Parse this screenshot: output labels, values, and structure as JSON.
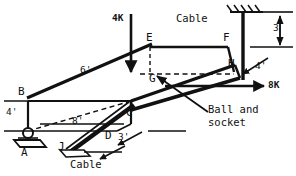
{
  "figure": {
    "type": "engineering-statics-free-body-diagram",
    "stroke_color": "#111111",
    "background_color": "#ffffff"
  },
  "points": [
    {
      "id": "A",
      "label": "A",
      "x": 27,
      "y": 155,
      "kind": "support-ball-and-socket"
    },
    {
      "id": "B",
      "label": "B",
      "x": 24,
      "y": 95,
      "kind": "vertex"
    },
    {
      "id": "C",
      "label": "C",
      "x": 130,
      "y": 115,
      "kind": "vertex"
    },
    {
      "id": "D",
      "label": "D",
      "x": 110,
      "y": 138,
      "kind": "vertex"
    },
    {
      "id": "E",
      "label": "E",
      "x": 150,
      "y": 41,
      "kind": "vertex"
    },
    {
      "id": "F",
      "label": "F",
      "x": 227,
      "y": 41,
      "kind": "vertex"
    },
    {
      "id": "G",
      "label": "G",
      "x": 154,
      "y": 80,
      "kind": "vertex"
    },
    {
      "id": "H",
      "label": "H",
      "x": 233,
      "y": 66,
      "kind": "vertex"
    },
    {
      "id": "J",
      "label": "J",
      "x": 62,
      "y": 149,
      "kind": "cable-anchor"
    }
  ],
  "dimensions": [
    {
      "id": "dim-6ft",
      "label": "6'",
      "x": 86,
      "y": 70,
      "axis": "diagonal-depth"
    },
    {
      "id": "dim-4ft-left",
      "label": "4'",
      "x": 10,
      "y": 112,
      "axis": "vertical"
    },
    {
      "id": "dim-8ft",
      "label": "8'",
      "x": 77,
      "y": 121,
      "axis": "horizontal"
    },
    {
      "id": "dim-3ft-bottom",
      "label": "3'",
      "x": 122,
      "y": 137,
      "axis": "depth"
    },
    {
      "id": "dim-4ft-right",
      "label": "4'",
      "x": 259,
      "y": 66,
      "axis": "depth"
    },
    {
      "id": "dim-3ft-right",
      "label": "3",
      "x": 275,
      "y": 28,
      "axis": "vertical"
    }
  ],
  "forces": [
    {
      "id": "force-4k",
      "label": "4K",
      "x": 116,
      "y": 19,
      "direction": "downward-vertical",
      "magnitude": "4K"
    },
    {
      "id": "force-8k",
      "label": "8K",
      "x": 272,
      "y": 80,
      "direction": "rightward-horizontal",
      "magnitude": "8K"
    }
  ],
  "annotations": [
    {
      "id": "cable-top",
      "label": "Cable",
      "x": 183,
      "y": 20
    },
    {
      "id": "cable-bottom",
      "label": "Cable",
      "x": 74,
      "y": 160
    },
    {
      "id": "ball-socket-line1",
      "label": "Ball and",
      "x": 212,
      "y": 106
    },
    {
      "id": "ball-socket-line2",
      "label": "socket",
      "x": 212,
      "y": 119
    }
  ]
}
